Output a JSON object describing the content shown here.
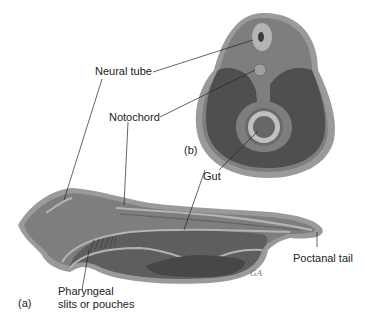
{
  "diagram": {
    "labels": {
      "neural_tube": "Neural tube",
      "notochord": "Notochord",
      "gut": "Gut",
      "panel_b": "(b)",
      "panel_a": "(a)",
      "postanal_tail": "Poctanal tail",
      "pharyngeal_line1": "Pharyngeal",
      "pharyngeal_line2": "slits or pouches"
    },
    "colors": {
      "outer_skin": "#9a9a9a",
      "body_mid": "#7a7a7a",
      "coelom_dark": "#4e4e4e",
      "structure_light": "#b4b4b4",
      "gut_lumen": "#666666",
      "neural_canal": "#3c3c3c"
    }
  }
}
